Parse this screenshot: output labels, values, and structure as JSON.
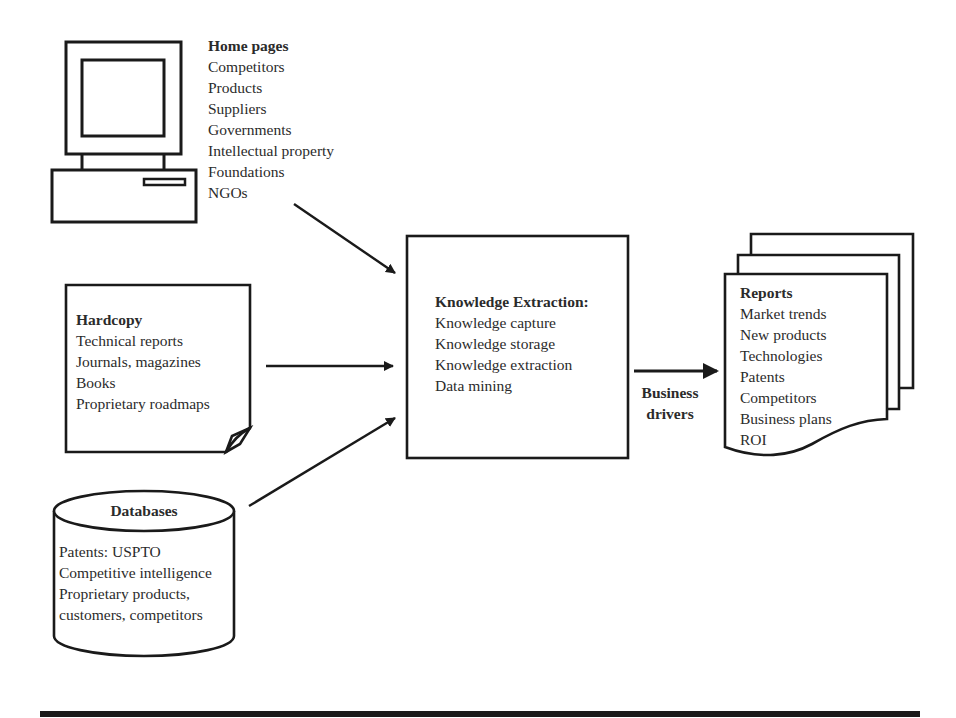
{
  "home_pages": {
    "title": "Home pages",
    "items": [
      "Competitors",
      "Products",
      "Suppliers",
      "Governments",
      "Intellectual property",
      "Foundations",
      "NGOs"
    ],
    "icon": "computer-icon"
  },
  "hardcopy": {
    "title": "Hardcopy",
    "items": [
      "Technical reports",
      "Journals, magazines",
      "Books",
      "Proprietary roadmaps"
    ],
    "icon": "document-folded-corner-icon"
  },
  "databases": {
    "title": "Databases",
    "items": [
      "Patents: USPTO",
      "Competitive intelligence",
      "Proprietary products,",
      "customers, competitors"
    ],
    "icon": "database-cylinder-icon"
  },
  "knowledge_extraction": {
    "title": "Knowledge Extraction:",
    "items": [
      "Knowledge capture",
      "Knowledge storage",
      "Knowledge extraction",
      "Data mining"
    ]
  },
  "connector": {
    "label_line1": "Business",
    "label_line2": "drivers"
  },
  "reports": {
    "title": "Reports",
    "items": [
      "Market trends",
      "New products",
      "Technologies",
      "Patents",
      "Competitors",
      "Business plans",
      "ROI"
    ],
    "icon": "stacked-documents-icon"
  },
  "colors": {
    "stroke": "#1a1a1a",
    "text": "#2b2b2b",
    "background": "#ffffff"
  }
}
